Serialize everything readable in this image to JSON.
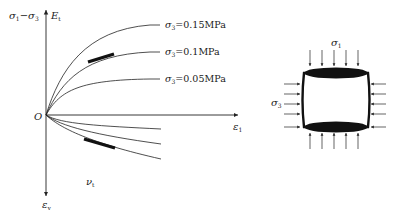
{
  "left_plot": {
    "y_axis_up_label": "σ1−σ3",
    "y_axis_up_label_main": "σ",
    "y_axis_up_sub1": "1",
    "y_axis_up_minus": "−σ",
    "y_axis_up_sub2": "3",
    "y_axis_up_secondary": "E",
    "y_axis_up_secondary_sub": "t",
    "origin_label": "O",
    "x_axis_label": "ε",
    "x_axis_label_sub": "1",
    "y_axis_down_label": "ε",
    "y_axis_down_label_sub": "v",
    "lower_curves_label": "ν",
    "lower_curves_label_sub": "t",
    "legend": [
      {
        "prefix": "σ",
        "sub": "3",
        "text": "=0.15MPa"
      },
      {
        "prefix": "σ",
        "sub": "3",
        "text": "=0.1MPa"
      },
      {
        "prefix": "σ",
        "sub": "3",
        "text": "=0.05MPa"
      }
    ]
  },
  "right_specimen": {
    "top_label": "σ",
    "top_label_sub": "1",
    "side_label": "σ",
    "side_label_sub": "3"
  },
  "colors": {
    "line": "#222222",
    "fill": "#111111"
  }
}
